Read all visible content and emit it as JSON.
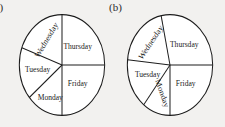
{
  "figure": {
    "background_color": "#f2f1ef",
    "stroke_color": "#1d1d1d",
    "fill_color": "#ffffff",
    "text_color": "#1a1a1a"
  },
  "panels": [
    {
      "id": "a",
      "label": "(a)",
      "label_clipped": true,
      "chart_data": {
        "type": "pie",
        "title": "",
        "categories": [
          "Thursday",
          "Friday",
          "Monday",
          "Tuesday",
          "Wednesday"
        ],
        "values": [
          90,
          90,
          50,
          60,
          70
        ],
        "units": "degrees",
        "labels_inside": true,
        "legend": "none",
        "grid": false,
        "start_angle_deg": 90,
        "direction": "clockwise",
        "slices": [
          {
            "name": "Thursday",
            "start_deg": 0,
            "end_deg": 90,
            "sweep_deg": 90,
            "label_angle_deg": 45,
            "label_radius": 0.52,
            "label_rotation_deg": 0
          },
          {
            "name": "Friday",
            "start_deg": 270,
            "end_deg": 360,
            "sweep_deg": 90,
            "label_angle_deg": 315,
            "label_radius": 0.52,
            "label_rotation_deg": 0
          },
          {
            "name": "Monday",
            "start_deg": 220,
            "end_deg": 270,
            "sweep_deg": 50,
            "label_angle_deg": 247,
            "label_radius": 0.7,
            "label_rotation_deg": 0
          },
          {
            "name": "Tuesday",
            "start_deg": 160,
            "end_deg": 220,
            "sweep_deg": 60,
            "label_angle_deg": 190,
            "label_radius": 0.58,
            "label_rotation_deg": 0
          },
          {
            "name": "Wednesday",
            "start_deg": 90,
            "end_deg": 160,
            "sweep_deg": 70,
            "label_angle_deg": 126,
            "label_radius": 0.6,
            "label_rotation_deg": -55
          }
        ]
      }
    },
    {
      "id": "b",
      "label": "(b)",
      "label_clipped": false,
      "chart_data": {
        "type": "pie",
        "title": "",
        "categories": [
          "Thursday",
          "Friday",
          "Monday",
          "Tuesday",
          "Wednesday"
        ],
        "values": [
          102,
          90,
          38,
          58,
          72
        ],
        "units": "degrees",
        "labels_inside": true,
        "legend": "none",
        "grid": false,
        "start_angle_deg": 102,
        "direction": "clockwise",
        "slices": [
          {
            "name": "Thursday",
            "start_deg": 0,
            "end_deg": 102,
            "sweep_deg": 102,
            "label_angle_deg": 50,
            "label_radius": 0.52,
            "label_rotation_deg": 0
          },
          {
            "name": "Friday",
            "start_deg": 270,
            "end_deg": 360,
            "sweep_deg": 90,
            "label_angle_deg": 315,
            "label_radius": 0.52,
            "label_rotation_deg": 0
          },
          {
            "name": "Monday",
            "start_deg": 232,
            "end_deg": 270,
            "sweep_deg": 38,
            "label_angle_deg": 251,
            "label_radius": 0.6,
            "label_rotation_deg": 68
          },
          {
            "name": "Tuesday",
            "start_deg": 174,
            "end_deg": 232,
            "sweep_deg": 58,
            "label_angle_deg": 200,
            "label_radius": 0.56,
            "label_rotation_deg": 0
          },
          {
            "name": "Wednesday",
            "start_deg": 102,
            "end_deg": 174,
            "sweep_deg": 72,
            "label_angle_deg": 135,
            "label_radius": 0.62,
            "label_rotation_deg": -52
          }
        ]
      }
    }
  ]
}
